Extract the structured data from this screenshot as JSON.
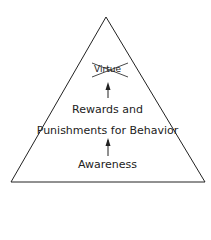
{
  "diagram": {
    "shape": "triangle",
    "top_label": "Virtue",
    "top_label_crossed_out": true,
    "middle_label_line1": "Rewards and",
    "middle_label_line2": "Punishments for Behavior",
    "bottom_label": "Awareness",
    "flow": [
      "Awareness",
      "Rewards and Punishments for Behavior",
      "Virtue"
    ],
    "line_color": "#222222"
  }
}
